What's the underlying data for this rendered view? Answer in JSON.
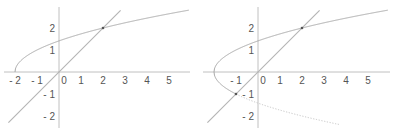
{
  "colors": {
    "axis": "#b0b0b0",
    "curve": "#a8a8a8",
    "line": "#b4b4b4",
    "dotted": "#c4c4c4",
    "point": "#555555",
    "text": "#555555"
  },
  "chart_data": [
    {
      "type": "line",
      "title": "",
      "xlabel": "",
      "ylabel": "",
      "xlim": [
        -2.6,
        5.9
      ],
      "ylim": [
        -2.5,
        3.0
      ],
      "grid": false,
      "x_ticks": [
        "-2",
        "-1",
        "0",
        "1",
        "2",
        "3",
        "4",
        "5"
      ],
      "y_ticks": [
        "2",
        "1",
        "-1",
        "-2"
      ],
      "series": [
        {
          "name": "y = sqrt(x+2)",
          "style": "solid",
          "x": [
            -2,
            -1.75,
            -1.5,
            -1,
            0,
            1,
            2,
            3,
            4,
            5,
            5.9
          ],
          "values": [
            0,
            0.5,
            0.71,
            1,
            1.41,
            1.73,
            2,
            2.24,
            2.45,
            2.65,
            2.81
          ]
        },
        {
          "name": "y = x",
          "style": "solid",
          "x": [
            -2.3,
            2.8
          ],
          "values": [
            -2.3,
            2.8
          ]
        }
      ],
      "points": [
        {
          "x": 2,
          "y": 2
        }
      ]
    },
    {
      "type": "line",
      "title": "",
      "xlabel": "",
      "ylabel": "",
      "xlim": [
        -2.6,
        5.9
      ],
      "ylim": [
        -2.5,
        3.0
      ],
      "grid": false,
      "x_ticks": [
        "-1",
        "0",
        "1",
        "2",
        "3",
        "4",
        "5"
      ],
      "y_ticks": [
        "2",
        "1",
        "-1",
        "-2"
      ],
      "series": [
        {
          "name": "y = sqrt(x+2)",
          "style": "solid",
          "x": [
            -2,
            -1.75,
            -1.5,
            -1,
            0,
            1,
            2,
            3,
            4,
            5,
            5.9
          ],
          "values": [
            0,
            0.5,
            0.71,
            1,
            1.41,
            1.73,
            2,
            2.24,
            2.45,
            2.65,
            2.81
          ]
        },
        {
          "name": "y = -sqrt(x+2)",
          "style": "solid-then-dotted",
          "x": [
            -2,
            -1.75,
            -1.5,
            -1,
            0,
            1,
            2,
            3,
            3.7
          ],
          "values": [
            0,
            -0.5,
            -0.71,
            -1,
            -1.41,
            -1.73,
            -2,
            -2.24,
            -2.39
          ]
        },
        {
          "name": "y = x",
          "style": "solid",
          "x": [
            -2.3,
            2.8
          ],
          "values": [
            -2.3,
            2.8
          ]
        }
      ],
      "points": [
        {
          "x": 2,
          "y": 2
        },
        {
          "x": -1,
          "y": -1
        }
      ]
    }
  ]
}
